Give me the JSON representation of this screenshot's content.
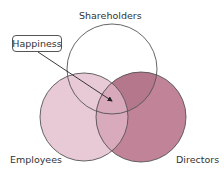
{
  "diagram": {
    "type": "venn",
    "sets": [
      {
        "id": "shareholders",
        "label": "Shareholders",
        "fill": "#ffffff",
        "stroke": "#555555"
      },
      {
        "id": "employees",
        "label": "Employees",
        "fill": "#e8c9d6",
        "stroke": "#555555"
      },
      {
        "id": "directors",
        "label": "Directors",
        "fill": "#c08398",
        "stroke": "#555555"
      }
    ],
    "intersections": {
      "employees_directors": "#d9a9bc",
      "shareholders_directors": "#b4778c",
      "shareholders_employees": "#e9c9d6"
    },
    "callout": {
      "label": "Happiness",
      "points_to": "center-intersection"
    }
  }
}
